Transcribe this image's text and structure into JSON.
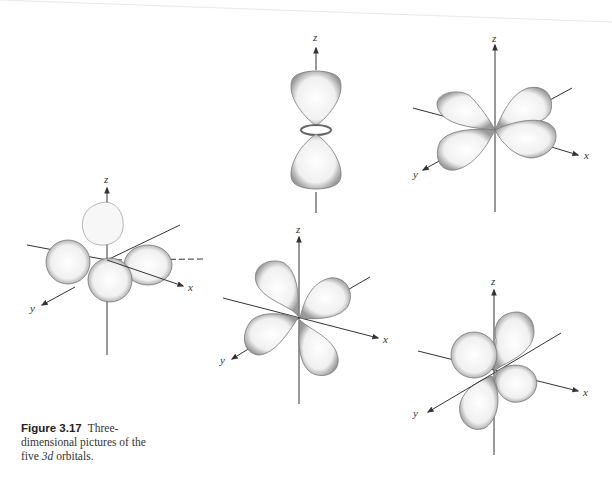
{
  "caption": {
    "label": "Figure 3.17",
    "text_1": "Three-dimensional pictures of the five ",
    "text_italic": "3d",
    "text_2": " orbitals."
  },
  "orbitals": [
    {
      "name": "d_z2",
      "axes": [
        "z"
      ],
      "position": "top-center"
    },
    {
      "name": "d_xy",
      "axes": [
        "z",
        "x",
        "y"
      ],
      "position": "top-right"
    },
    {
      "name": "d_x2-y2",
      "axes": [
        "z",
        "x",
        "y"
      ],
      "position": "middle-left"
    },
    {
      "name": "d_xz",
      "axes": [
        "z",
        "x",
        "y"
      ],
      "position": "bottom-center"
    },
    {
      "name": "d_yz",
      "axes": [
        "z",
        "x",
        "y"
      ],
      "position": "bottom-right"
    }
  ],
  "axis_labels": {
    "x": "x",
    "y": "y",
    "z": "z"
  },
  "colors": {
    "line": "#333333",
    "lobe_fill": "#f4f4f4",
    "lobe_edge": "#777777"
  }
}
